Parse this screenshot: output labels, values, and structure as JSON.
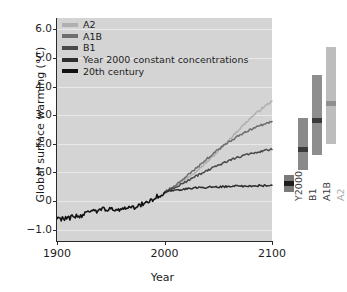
{
  "chart_data": {
    "type": "line",
    "title": "",
    "xlabel": "Year",
    "ylabel": "Global surface warming (°C)",
    "xlim": [
      1900,
      2100
    ],
    "ylim": [
      -1.4,
      6.4
    ],
    "xticks": [
      1900,
      2000,
      2100
    ],
    "xticklabels": [
      "1900",
      "2000",
      "2100"
    ],
    "yticks": [
      -1.0,
      0,
      1.0,
      2.0,
      3.0,
      4.0,
      5.0,
      6.0
    ],
    "yticklabels": [
      "−1.0",
      "0",
      "1.0",
      "2.0",
      "3.0",
      "4.0",
      "5.0",
      "6.0"
    ],
    "grid": true,
    "legend_position": "upper left",
    "series": [
      {
        "name": "A2",
        "color": "#b0b0b0",
        "x": [
          2000,
          2010,
          2020,
          2030,
          2040,
          2050,
          2060,
          2070,
          2080,
          2090,
          2100
        ],
        "values": [
          0.3,
          0.52,
          0.78,
          1.06,
          1.38,
          1.74,
          2.13,
          2.53,
          2.9,
          3.22,
          3.5
        ]
      },
      {
        "name": "A1B",
        "color": "#6e6e6e",
        "x": [
          2000,
          2010,
          2020,
          2030,
          2040,
          2050,
          2060,
          2070,
          2080,
          2090,
          2100
        ],
        "values": [
          0.3,
          0.55,
          0.85,
          1.16,
          1.49,
          1.8,
          2.07,
          2.3,
          2.49,
          2.65,
          2.78
        ]
      },
      {
        "name": "B1",
        "color": "#4a4a4a",
        "x": [
          2000,
          2010,
          2020,
          2030,
          2040,
          2050,
          2060,
          2070,
          2080,
          2090,
          2100
        ],
        "values": [
          0.3,
          0.48,
          0.68,
          0.88,
          1.07,
          1.25,
          1.41,
          1.55,
          1.66,
          1.74,
          1.8
        ]
      },
      {
        "name": "Year 2000 constant concentrations",
        "color": "#2e2e2e",
        "x": [
          2000,
          2010,
          2020,
          2030,
          2040,
          2050,
          2060,
          2070,
          2080,
          2090,
          2100
        ],
        "values": [
          0.3,
          0.38,
          0.43,
          0.46,
          0.48,
          0.49,
          0.51,
          0.52,
          0.53,
          0.54,
          0.55
        ]
      },
      {
        "name": "20th century",
        "color": "#111111",
        "x": [
          1900,
          1910,
          1920,
          1930,
          1940,
          1950,
          1960,
          1970,
          1980,
          1990,
          2000
        ],
        "values": [
          -0.62,
          -0.6,
          -0.52,
          -0.42,
          -0.3,
          -0.3,
          -0.28,
          -0.25,
          -0.1,
          0.08,
          0.3
        ]
      }
    ],
    "range_bars": {
      "axis_label": "",
      "items": [
        {
          "name": "Y2000",
          "label": "Y2000",
          "color": "#7a7a7a",
          "low": 0.3,
          "high": 0.9,
          "best": 0.6
        },
        {
          "name": "B1",
          "label": "B1",
          "color": "#8a8a8a",
          "low": 1.1,
          "high": 2.9,
          "best": 1.8
        },
        {
          "name": "A1B",
          "label": "A1B",
          "color": "#8e8e8e",
          "low": 1.6,
          "high": 4.4,
          "best": 2.8
        },
        {
          "name": "A2",
          "label": "A2",
          "color": "#bdbdbd",
          "low": 2.0,
          "high": 5.4,
          "best": 3.4
        }
      ]
    }
  },
  "legend": {
    "items": [
      {
        "label": "A2",
        "color": "#b0b0b0"
      },
      {
        "label": "A1B",
        "color": "#6e6e6e"
      },
      {
        "label": "B1",
        "color": "#4a4a4a"
      },
      {
        "label": "Year 2000 constant concentrations",
        "color": "#2e2e2e"
      },
      {
        "label": "20th century",
        "color": "#111111"
      }
    ]
  },
  "axes": {
    "x_title": "Year",
    "y_title": "Global surface warming (°C)"
  },
  "colors": {
    "panel_background": "#d4d4d4",
    "gridline": "#e9e9e9",
    "axis": "#2a2a2a",
    "text": "#1c1c1c",
    "figure_background": "#ffffff"
  }
}
